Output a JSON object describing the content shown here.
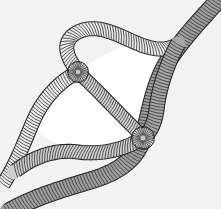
{
  "figure": {
    "width": 221,
    "height": 209
  },
  "palette": {
    "background": "#f2f2f2",
    "aperture_fill": "#ffffff",
    "strand_dark_fill": "#9e9e9e",
    "strand_mid_fill": "#c9c9c9",
    "strand_light_fill": "#ededed",
    "outline": "#2b2b2b",
    "coil_line": "#3a3a3a",
    "edge_line": "#262626"
  },
  "regions": [
    {
      "name": "background-field",
      "label": "Background matrix",
      "fill": "#f2f2f2"
    },
    {
      "name": "aperture-upper",
      "label": "Upper triangular aperture",
      "fill": "#ffffff"
    },
    {
      "name": "aperture-lower",
      "label": "Lower triangular aperture",
      "fill": "#ffffff"
    }
  ],
  "strands": [
    {
      "id": "strand-main-diagonal",
      "label": "Primary thick strand (top-right to bottom-left)",
      "shade": "dark",
      "fill": "#9e9e9e",
      "width": 17,
      "coil_pitch": 3.1,
      "path": "M 231 -14 C 208 12, 186 34, 170 58 C 154 82, 150 112, 143 138 C 136 160, 118 172, 92 180 C 66 188, 36 196, 8 212",
      "coil_tilt": -26
    },
    {
      "id": "strand-left-arc",
      "label": "Left boundary strand",
      "shade": "light",
      "fill": "#ededed",
      "width": 14,
      "coil_pitch": 2.8,
      "path": "M 78 72 C 58 82, 42 100, 32 124 C 22 148, 14 168, 2 186",
      "coil_tilt": 18
    },
    {
      "id": "strand-top-arc",
      "label": "Upper boundary strand",
      "shade": "light",
      "fill": "#ededed",
      "width": 14,
      "coil_pitch": 2.8,
      "path": "M 78 72 C 64 54, 62 40, 78 32 C 96 23, 116 34, 134 42 C 152 50, 166 52, 178 44",
      "coil_tilt": -72
    },
    {
      "id": "strand-center-cross",
      "label": "Central crossing strand",
      "shade": "mid",
      "fill": "#d4d4d4",
      "width": 13,
      "coil_pitch": 2.6,
      "path": "M 78 72 C 95 88, 112 106, 128 122 C 134 128, 139 133, 143 138",
      "coil_tilt": -42
    },
    {
      "id": "strand-bottom-arc",
      "label": "Lower boundary strand",
      "shade": "mid",
      "fill": "#cfcfcf",
      "width": 14,
      "coil_pitch": 2.8,
      "path": "M 143 138 C 124 150, 100 155, 78 152 C 56 149, 34 156, 14 172",
      "coil_tilt": 68
    },
    {
      "id": "strand-right-arc",
      "label": "Right boundary strand",
      "shade": "dark",
      "fill": "#a6a6a6",
      "width": 15,
      "coil_pitch": 3.0,
      "path": "M 178 44 C 168 62, 160 84, 157 106 C 155 124, 150 132, 143 138",
      "coil_tilt": 6
    }
  ],
  "junctions": [
    {
      "id": "junction-upper-left",
      "label": "Upper-left strand convergence node",
      "x": 78,
      "y": 72,
      "radius": 11
    },
    {
      "id": "junction-lower-right",
      "label": "Lower-right strand convergence node",
      "x": 143,
      "y": 138,
      "radius": 12
    }
  ]
}
